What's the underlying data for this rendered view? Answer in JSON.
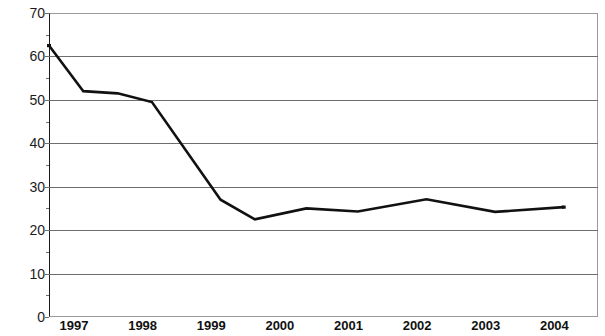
{
  "chart_data": {
    "type": "line",
    "title": "",
    "subtitle": "",
    "xlabel": "",
    "ylabel": "",
    "xlim": [
      1997,
      2005
    ],
    "ylim": [
      0,
      70
    ],
    "grid": true,
    "legend": false,
    "legend_position": "none",
    "y_ticks": [
      0,
      10,
      20,
      30,
      40,
      50,
      60,
      70
    ],
    "y_tick_labels": [
      "0",
      "10",
      "20",
      "30",
      "40",
      "50",
      "60",
      "70"
    ],
    "x_tick_labels": [
      "1997",
      "1998",
      "1999",
      "2000",
      "2001",
      "2002",
      "2003",
      "2004",
      "2005"
    ],
    "x_tick_values": [
      1997,
      1998,
      1999,
      2000,
      2001,
      2002,
      2003,
      2004,
      2005
    ],
    "series": [
      {
        "name": "series-1",
        "color": "#111111",
        "line_width": 2.6,
        "x": [
          1997.0,
          1997.5,
          1998.0,
          1998.5,
          1999.5,
          2000.0,
          2000.75,
          2001.5,
          2002.5,
          2003.5,
          2004.5
        ],
        "values": [
          62.5,
          52.0,
          51.5,
          49.5,
          27.0,
          22.5,
          25.0,
          24.3,
          27.1,
          24.2,
          25.3
        ],
        "points": [
          {
            "x": 1997.0,
            "y": 62.5
          },
          {
            "x": 1997.5,
            "y": 52.0
          },
          {
            "x": 1998.0,
            "y": 51.5
          },
          {
            "x": 1998.5,
            "y": 49.5
          },
          {
            "x": 1999.5,
            "y": 27.0
          },
          {
            "x": 2000.0,
            "y": 22.5
          },
          {
            "x": 2000.75,
            "y": 25.0
          },
          {
            "x": 2001.5,
            "y": 24.3
          },
          {
            "x": 2002.5,
            "y": 27.1
          },
          {
            "x": 2003.5,
            "y": 24.2
          },
          {
            "x": 2004.5,
            "y": 25.3
          }
        ]
      }
    ],
    "colors": {
      "line": "#111111",
      "grid": "#6e6e6e",
      "axis": "#1a1a1a",
      "background": "#ffffff",
      "text": "#111111"
    }
  }
}
